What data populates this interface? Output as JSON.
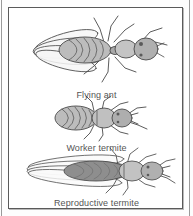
{
  "figure": {
    "background_color": "#ffffff",
    "frame_color": "#5a5a5a",
    "caption_color": "#555555",
    "line_art_color": "#4a4a4a",
    "body_fill_color": "#b4b4b4",
    "wing_fill_color": "#f2f2f2",
    "dark_body_color": "#8a8a8a"
  },
  "specimens": [
    {
      "id": "flying-ant",
      "caption": "Flying ant",
      "wings": "four oval wings, left side",
      "body": "narrow waist, striped abdomen",
      "legs": 6,
      "antennae": "elbowed"
    },
    {
      "id": "worker-termite",
      "caption": "Worker termite",
      "wings": "none",
      "body": "broad waist, banded abdomen",
      "legs": 6,
      "antennae": "straight beaded"
    },
    {
      "id": "reproductive-termite",
      "caption": "Reproductive termite",
      "wings": "four long narrow equal wings, left side",
      "body": "broad waist, dark elongated abdomen",
      "legs": 6,
      "antennae": "straight beaded"
    }
  ]
}
